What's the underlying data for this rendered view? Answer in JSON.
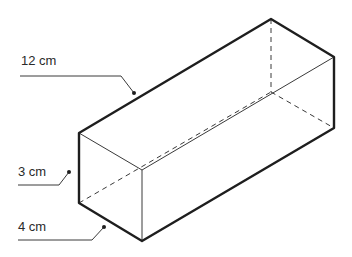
{
  "figure": {
    "type": "rectangular prism (cuboid)",
    "labels": {
      "length": "12 cm",
      "height": "3 cm",
      "width": "4 cm"
    },
    "vertices": {
      "front_left_top": [
        79,
        133
      ],
      "front_left_bottom": [
        79,
        203
      ],
      "front_right_top": [
        142,
        170
      ],
      "front_right_bottom": [
        142,
        241
      ],
      "back_top": [
        271,
        19
      ],
      "right_top": [
        334,
        57
      ],
      "right_bottom": [
        334,
        128
      ],
      "back_bottom_hidden": [
        271,
        92
      ]
    },
    "colors": {
      "line": "#1e1e1e",
      "text": "#2a2a2a",
      "background": "#ffffff"
    }
  }
}
